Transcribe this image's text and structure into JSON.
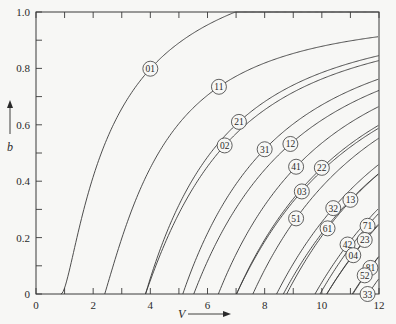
{
  "chart_data": {
    "type": "line",
    "title": "",
    "xlabel": "V",
    "ylabel": "b",
    "xlim": [
      0,
      12
    ],
    "ylim": [
      0,
      1.0
    ],
    "grid": false,
    "legend_position": "inline circled labels on curves",
    "x_ticks": [
      "0",
      "2",
      "4",
      "6",
      "8",
      "10",
      "12"
    ],
    "y_ticks": [
      "0",
      "0.2",
      "0.4",
      "0.6",
      "0.8",
      "1.0"
    ],
    "series": [
      {
        "name": "01",
        "cutoff_V": 0.0,
        "asymptote_u": 2.405,
        "label_at": [
          4.0,
          0.85
        ]
      },
      {
        "name": "11",
        "cutoff_V": 2.405,
        "asymptote_u": 3.832,
        "label_at": [
          6.4,
          0.72
        ]
      },
      {
        "name": "21",
        "cutoff_V": 3.832,
        "asymptote_u": 5.136,
        "label_at": [
          7.1,
          0.63
        ]
      },
      {
        "name": "02",
        "cutoff_V": 3.832,
        "asymptote_u": 5.52,
        "label_at": [
          6.6,
          0.57
        ]
      },
      {
        "name": "31",
        "cutoff_V": 5.136,
        "asymptote_u": 6.38,
        "label_at": [
          8.0,
          0.56
        ]
      },
      {
        "name": "12",
        "cutoff_V": 5.52,
        "asymptote_u": 7.016,
        "label_at": [
          8.9,
          0.55
        ]
      },
      {
        "name": "41",
        "cutoff_V": 6.38,
        "asymptote_u": 7.588,
        "label_at": [
          9.1,
          0.47
        ]
      },
      {
        "name": "22",
        "cutoff_V": 7.016,
        "asymptote_u": 8.417,
        "label_at": [
          10.0,
          0.44
        ]
      },
      {
        "name": "03",
        "cutoff_V": 7.016,
        "asymptote_u": 8.654,
        "label_at": [
          9.3,
          0.38
        ]
      },
      {
        "name": "51",
        "cutoff_V": 7.588,
        "asymptote_u": 8.771,
        "label_at": [
          9.1,
          0.33
        ]
      },
      {
        "name": "32",
        "cutoff_V": 8.417,
        "asymptote_u": 9.761,
        "label_at": [
          10.4,
          0.36
        ]
      },
      {
        "name": "13",
        "cutoff_V": 8.654,
        "asymptote_u": 10.173,
        "label_at": [
          11.0,
          0.36
        ]
      },
      {
        "name": "61",
        "cutoff_V": 8.771,
        "asymptote_u": 9.936,
        "label_at": [
          10.2,
          0.3
        ]
      },
      {
        "name": "71",
        "cutoff_V": 9.936,
        "asymptote_u": 11.086,
        "label_at": [
          11.6,
          0.24
        ]
      },
      {
        "name": "42",
        "cutoff_V": 9.761,
        "asymptote_u": 11.065,
        "label_at": [
          10.9,
          0.18
        ]
      },
      {
        "name": "23",
        "cutoff_V": 10.173,
        "asymptote_u": 11.62,
        "label_at": [
          11.5,
          0.18
        ]
      },
      {
        "name": "04",
        "cutoff_V": 10.173,
        "asymptote_u": 11.792,
        "label_at": [
          11.1,
          0.11
        ]
      },
      {
        "name": "81",
        "cutoff_V": 11.086,
        "asymptote_u": 12.225,
        "label_at": [
          11.7,
          0.11
        ]
      },
      {
        "name": "52",
        "cutoff_V": 11.065,
        "asymptote_u": 12.339,
        "label_at": [
          11.5,
          0.06
        ]
      },
      {
        "name": "33",
        "cutoff_V": 11.62,
        "asymptote_u": 13.015,
        "label_at": [
          11.6,
          0.02
        ]
      }
    ]
  },
  "axes": {
    "x_label": "V",
    "y_label": "b"
  }
}
